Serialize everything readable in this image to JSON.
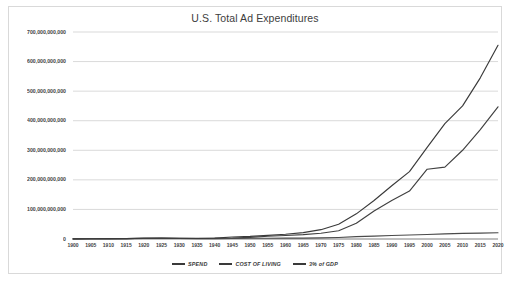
{
  "chart_data": {
    "type": "line",
    "title": "U.S. Total Ad Expenditures",
    "xlabel": "",
    "ylabel": "",
    "grid": true,
    "legend_position": "bottom",
    "xlim": [
      1900,
      2020
    ],
    "ylim": [
      0,
      700000000000
    ],
    "ytick_labels": [
      "700,000,000,000",
      "600,000,000,000",
      "500,000,000,000",
      "400,000,000,000",
      "300,000,000,000",
      "200,000,000,000",
      "100,000,000,000",
      "0"
    ],
    "ytick_values": [
      700000000000,
      600000000000,
      500000000000,
      400000000000,
      300000000000,
      200000000000,
      100000000000,
      0
    ],
    "x": [
      1900,
      1905,
      1910,
      1915,
      1920,
      1925,
      1930,
      1935,
      1940,
      1945,
      1950,
      1955,
      1960,
      1965,
      1970,
      1975,
      1980,
      1985,
      1990,
      1995,
      2000,
      2005,
      2010,
      2015,
      2020
    ],
    "categories": [
      "1900",
      "1905",
      "1910",
      "1915",
      "1920",
      "1925",
      "1930",
      "1935",
      "1940",
      "1945",
      "1950",
      "1955",
      "1960",
      "1965",
      "1970",
      "1975",
      "1980",
      "1985",
      "1990",
      "1995",
      "2000",
      "2005",
      "2010",
      "2015",
      "2020"
    ],
    "series": [
      {
        "name": "SPEND",
        "color": "#404040",
        "values": [
          500000000,
          700000000,
          900000000,
          1100000000,
          2900000000,
          3100000000,
          2600000000,
          1700000000,
          2100000000,
          2900000000,
          5700000000,
          9200000000,
          12000000000,
          15000000000,
          19600000000,
          28000000000,
          53000000000,
          95000000000,
          130000000000,
          162000000000,
          236000000000,
          243000000000,
          300000000000,
          370000000000,
          447000000000
        ]
      },
      {
        "name": "COST OF LIVING",
        "color": "#4a4a4a",
        "values": [
          0,
          300000000,
          600000000,
          900000000,
          1800000000,
          1700000000,
          1600000000,
          1300000000,
          1400000000,
          1800000000,
          2400000000,
          2700000000,
          3000000000,
          3200000000,
          3700000000,
          5100000000,
          7800000000,
          9900000000,
          11800000000,
          13400000000,
          15200000000,
          17200000000,
          19000000000,
          20000000000,
          21000000000
        ]
      },
      {
        "name": "3% of GDP",
        "color": "#3a3a3a",
        "values": [
          600000000,
          800000000,
          1100000000,
          1500000000,
          2700000000,
          2900000000,
          2700000000,
          2100000000,
          3000000000,
          6600000000,
          8700000000,
          12300000000,
          16000000000,
          21500000000,
          31500000000,
          50000000000,
          85000000000,
          130000000000,
          180000000000,
          228000000000,
          310000000000,
          390000000000,
          450000000000,
          545000000000,
          655000000000
        ]
      }
    ]
  },
  "legend": {
    "items": [
      {
        "label": "SPEND"
      },
      {
        "label": "COST OF LIVING"
      },
      {
        "label": "3% of GDP"
      }
    ]
  },
  "colors": {
    "frame_border": "#d9d9d9",
    "gridline": "#c8c8c8",
    "axis": "#808080",
    "text": "#3f3f3f",
    "background": "#ffffff"
  }
}
